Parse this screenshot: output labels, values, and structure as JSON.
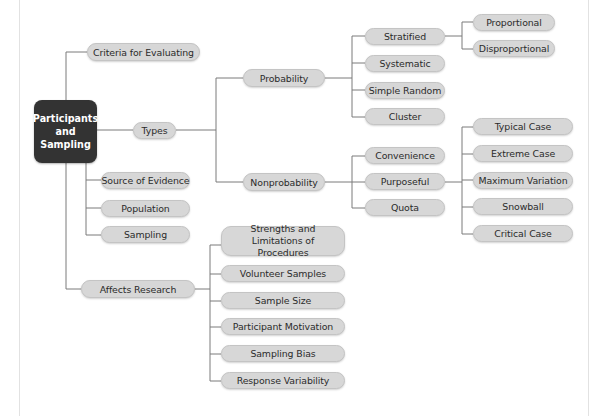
{
  "diagram": {
    "type": "mind-map",
    "root": {
      "label": "Participants and Sampling",
      "lines": [
        "Participants",
        "and",
        "Sampling"
      ],
      "fill": "#333333",
      "text_color": "#ffffff"
    },
    "node_fill": "#d7d7d7",
    "connector_color": "#7a7a7a",
    "branches": {
      "criteria": {
        "label": "Criteria for Evaluating"
      },
      "types": {
        "label": "Types",
        "probability": {
          "label": "Probability",
          "children": {
            "stratified": {
              "label": "Stratified",
              "children": [
                "Proportional",
                "Disproportional"
              ]
            },
            "systematic": {
              "label": "Systematic"
            },
            "simple_random": {
              "label": "Simple Random"
            },
            "cluster": {
              "label": "Cluster"
            }
          }
        },
        "nonprobability": {
          "label": "Nonprobability",
          "children": {
            "convenience": {
              "label": "Convenience"
            },
            "purposeful": {
              "label": "Purposeful",
              "children": [
                "Typical Case",
                "Extreme Case",
                "Maximum Variation",
                "Snowball",
                "Critical Case"
              ]
            },
            "quota": {
              "label": "Quota"
            }
          }
        }
      },
      "source_of_evidence": {
        "label": "Source of Evidence"
      },
      "population": {
        "label": "Population"
      },
      "sampling": {
        "label": "Sampling"
      },
      "affects_research": {
        "label": "Affects Research",
        "children": [
          "Strengths and Limitations of Procedures",
          "Volunteer Samples",
          "Sample Size",
          "Participant Motivation",
          "Sampling Bias",
          "Response Variability"
        ]
      }
    }
  }
}
